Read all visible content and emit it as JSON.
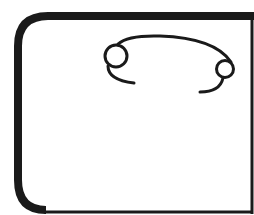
{
  "drawing": {
    "description": "Line-art sketch: rounded rectangular frame with a curved wire ending in two small loops",
    "colors": {
      "background": "#ffffff",
      "stroke": "#1a1a1a"
    },
    "frame": {
      "stroke_width": 8,
      "corner_radius": 30
    },
    "loops": [
      {
        "name": "left-loop",
        "cx": 116,
        "cy": 55,
        "r": 11
      },
      {
        "name": "right-loop",
        "cx": 225,
        "cy": 68,
        "r": 8
      }
    ]
  }
}
